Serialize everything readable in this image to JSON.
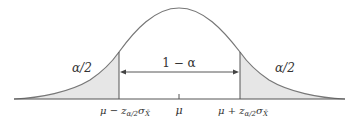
{
  "diagram": {
    "type": "normal-distribution-confidence-interval",
    "colors": {
      "curve": "#777777",
      "shade": "#e6e6e6",
      "axis": "#555555",
      "text": "#333333"
    },
    "labels": {
      "left_tail": "α/2",
      "right_tail": "α/2",
      "center_interval": "1 − α",
      "mu": "μ",
      "left_bound_main": "μ − z",
      "left_bound_sub": "α/2",
      "left_bound_sigma": "σ",
      "left_bound_sigma_sub": "X̄",
      "right_bound_main": "μ + z",
      "right_bound_sub": "α/2",
      "right_bound_sigma": "σ",
      "right_bound_sigma_sub": "X̄"
    }
  }
}
